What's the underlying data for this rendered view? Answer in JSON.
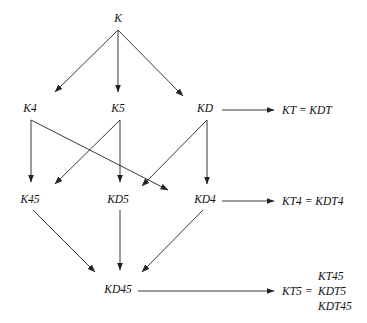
{
  "diagram": {
    "type": "lattice",
    "nodes": [
      {
        "id": "K",
        "label": "K"
      },
      {
        "id": "K4",
        "label": "K4"
      },
      {
        "id": "K5",
        "label": "K5"
      },
      {
        "id": "KD",
        "label": "KD"
      },
      {
        "id": "K45",
        "label": "K45"
      },
      {
        "id": "KD5",
        "label": "KD5"
      },
      {
        "id": "KD4",
        "label": "KD4"
      },
      {
        "id": "KD45",
        "label": "KD45"
      }
    ],
    "edges": [
      {
        "from": "K",
        "to": "K4"
      },
      {
        "from": "K",
        "to": "K5"
      },
      {
        "from": "K",
        "to": "KD"
      },
      {
        "from": "K4",
        "to": "K45"
      },
      {
        "from": "K4",
        "to": "KD4"
      },
      {
        "from": "K5",
        "to": "K45"
      },
      {
        "from": "K5",
        "to": "KD5"
      },
      {
        "from": "KD",
        "to": "KD5"
      },
      {
        "from": "KD",
        "to": "KD4"
      },
      {
        "from": "K45",
        "to": "KD45"
      },
      {
        "from": "KD5",
        "to": "KD45"
      },
      {
        "from": "KD4",
        "to": "KD45"
      }
    ],
    "equivalences": [
      {
        "from": "KD",
        "label": "KT = KDT"
      },
      {
        "from": "KD4",
        "label": "KT4 = KDT4"
      },
      {
        "from": "KD45",
        "label": "KT5 =",
        "list": [
          "KT45",
          "KDT5",
          "KDT45"
        ]
      }
    ]
  }
}
